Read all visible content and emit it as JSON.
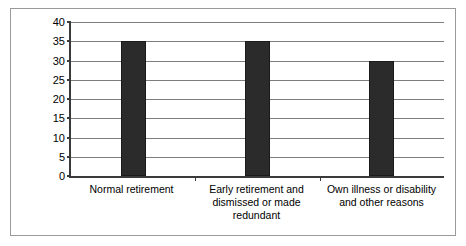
{
  "chart_data": {
    "type": "bar",
    "title": "",
    "subtitle": "",
    "xlabel": "",
    "ylabel": "",
    "categories": [
      "Normal retirement",
      "Early retirement and dismissed or made redundant",
      "Own illness or disability and other reasons"
    ],
    "values": [
      35,
      35,
      30
    ],
    "ylim": [
      0,
      40
    ],
    "ytick_labels": [
      "0",
      "5",
      "10",
      "15",
      "20",
      "25",
      "30",
      "35",
      "40"
    ],
    "ytick_values": [
      0,
      5,
      10,
      15,
      20,
      25,
      30,
      35,
      40
    ],
    "grid": "horizontal",
    "legend": "none",
    "series": [
      {
        "name": "",
        "values": [
          35,
          35,
          30
        ],
        "color": "#2b2b2b"
      }
    ],
    "annotations": []
  },
  "style": {
    "bar_color": "#2b2b2b",
    "gridline_color": "#7d7d7d",
    "axis_color": "#3a3a3a",
    "frame_color": "#9a9a9a",
    "plot_background": "#ffffff"
  }
}
